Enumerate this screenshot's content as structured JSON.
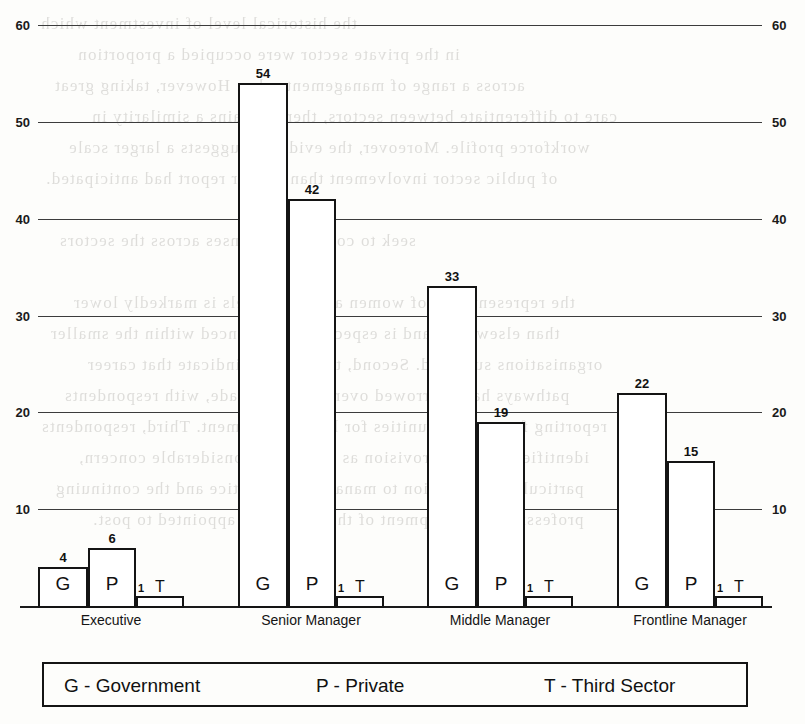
{
  "chart_data": {
    "type": "bar",
    "title": "",
    "subtitle": "",
    "xlabel": "",
    "ylabel": "",
    "ylim": [
      0,
      60
    ],
    "grid": true,
    "legend_position": "bottom",
    "dual_axis": true,
    "categories": [
      "Executive",
      "Senior Manager",
      "Middle Manager",
      "Frontline Manager"
    ],
    "series": [
      {
        "name": "Government",
        "code": "G",
        "values": [
          4,
          54,
          33,
          22
        ]
      },
      {
        "name": "Private",
        "code": "P",
        "values": [
          6,
          42,
          19,
          15
        ]
      },
      {
        "name": "Third Sector",
        "code": "T",
        "values": [
          1,
          1,
          1,
          1
        ]
      }
    ],
    "y_ticks_left": [
      "60",
      "50",
      "40",
      "30",
      "20",
      "10"
    ],
    "y_ticks_right": [
      "60",
      "50",
      "40",
      "30",
      "20",
      "10"
    ]
  },
  "axis": {
    "ticks": [
      {
        "label": "60",
        "value": 60
      },
      {
        "label": "50",
        "value": 50
      },
      {
        "label": "40",
        "value": 40
      },
      {
        "label": "30",
        "value": 30
      },
      {
        "label": "20",
        "value": 20
      },
      {
        "label": "10",
        "value": 10
      }
    ]
  },
  "groups": [
    {
      "label": "Executive",
      "bars": [
        {
          "letter": "G",
          "value": "4",
          "series": "Government"
        },
        {
          "letter": "P",
          "value": "6",
          "series": "Private"
        },
        {
          "letter": "T",
          "value": "1",
          "series": "Third Sector"
        }
      ]
    },
    {
      "label": "Senior Manager",
      "bars": [
        {
          "letter": "G",
          "value": "54",
          "series": "Government"
        },
        {
          "letter": "P",
          "value": "42",
          "series": "Private"
        },
        {
          "letter": "T",
          "value": "1",
          "series": "Third Sector"
        }
      ]
    },
    {
      "label": "Middle Manager",
      "bars": [
        {
          "letter": "G",
          "value": "33",
          "series": "Government"
        },
        {
          "letter": "P",
          "value": "19",
          "series": "Private"
        },
        {
          "letter": "T",
          "value": "1",
          "series": "Third Sector"
        }
      ]
    },
    {
      "label": "Frontline Manager",
      "bars": [
        {
          "letter": "G",
          "value": "22",
          "series": "Government"
        },
        {
          "letter": "P",
          "value": "15",
          "series": "Private"
        },
        {
          "letter": "T",
          "value": "1",
          "series": "Third Sector"
        }
      ]
    }
  ],
  "legend": {
    "entries": [
      {
        "text": "G - Government"
      },
      {
        "text": "P - Private"
      },
      {
        "text": "T - Third Sector"
      }
    ]
  },
  "colors": {
    "ink": "#141414",
    "gridline": "#3c3c3c",
    "paper": "#fdfdfb",
    "bar_fill": "#ffffff"
  },
  "showthrough": {
    "lines": [
      "the historical level of investment which",
      "in the private sector were occupied a proportion",
      "across a range of management roles. However, taking great",
      "care to differentiate between sectors, there remains a similarity in",
      "workforce profile. Moreover, the evidence suggests a larger scale",
      "of public sector involvement than a prior report had anticipated.",
      "",
      "seek to compare responses across the sectors",
      "",
      "the representation of women at senior levels is markedly lower",
      "than elsewhere, and is especially pronounced within the smaller",
      "organisations surveyed. Second, the findings indicate that career",
      "pathways have narrowed over the last decade, with respondents",
      "reporting fewer opportunities for lateral movement. Third, respondents",
      "identified training provision as an area of considerable concern,",
      "particularly in relation to management practice and the continuing",
      "professional development of those recently appointed to post."
    ]
  }
}
